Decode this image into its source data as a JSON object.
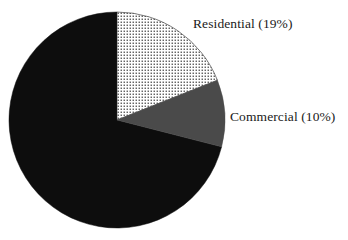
{
  "background_color": "#ffffff",
  "chart_data": {
    "type": "pie",
    "title": "",
    "subtitle": "",
    "xlabel": "",
    "ylabel": "",
    "legend_position": "none",
    "grid": false,
    "labels_shown_on_chart": true,
    "start_angle_deg": 0,
    "direction": "clockwise",
    "center": {
      "x": 117,
      "y": 120
    },
    "radius": 108,
    "categories": [
      "Residential",
      "Commercial",
      "Other"
    ],
    "values": [
      19,
      10,
      71
    ],
    "units": "%",
    "slices": [
      {
        "name": "Residential",
        "label": "Residential (19%)",
        "value": 19,
        "start_angle_deg": 0,
        "end_angle_deg": 68.4,
        "fill_style": "dotted",
        "fill_color": "#ffffff",
        "pattern_color": "#2a2a2a",
        "labeled": true
      },
      {
        "name": "Commercial",
        "label": "Commercial (10%)",
        "value": 10,
        "start_angle_deg": 68.4,
        "end_angle_deg": 104.4,
        "fill_style": "solid",
        "fill_color": "#4a4a4a",
        "pattern_color": "",
        "labeled": true
      },
      {
        "name": "Other",
        "label": "",
        "value": 71,
        "start_angle_deg": 104.4,
        "end_angle_deg": 360,
        "fill_style": "solid",
        "fill_color": "#0d0d0d",
        "pattern_color": "",
        "labeled": false
      }
    ]
  },
  "labels": {
    "residential": "Residential (19%)",
    "commercial": "Commercial (10%)"
  }
}
